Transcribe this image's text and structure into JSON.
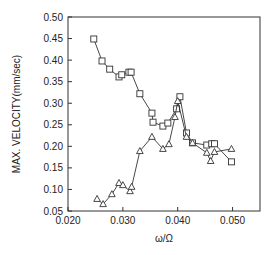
{
  "chart_data": {
    "type": "line",
    "title": "",
    "xlabel": "ω/Ω",
    "ylabel": "MAX. VELOCITY(mm/sec)",
    "xlim": [
      0.02,
      0.055
    ],
    "ylim": [
      0.05,
      0.5
    ],
    "xticks": [
      "0.020",
      "0.030",
      "0.040",
      "0.050"
    ],
    "xtick_values": [
      0.02,
      0.03,
      0.04,
      0.05
    ],
    "yticks": [
      "0.05",
      "0.10",
      "0.15",
      "0.20",
      "0.25",
      "0.30",
      "0.35",
      "0.40",
      "0.45",
      "0.50"
    ],
    "ytick_values": [
      0.05,
      0.1,
      0.15,
      0.2,
      0.25,
      0.3,
      0.35,
      0.4,
      0.45,
      0.5
    ],
    "grid": false,
    "legend": null,
    "series": [
      {
        "name": "squares",
        "marker": "square",
        "x": [
          0.0247,
          0.0262,
          0.0276,
          0.0293,
          0.0298,
          0.0311,
          0.0315,
          0.0331,
          0.0353,
          0.0355,
          0.0373,
          0.0382,
          0.0398,
          0.0404,
          0.0416,
          0.0427,
          0.0453,
          0.0462,
          0.0467,
          0.0498
        ],
        "y": [
          0.449,
          0.398,
          0.379,
          0.361,
          0.366,
          0.372,
          0.372,
          0.322,
          0.277,
          0.256,
          0.247,
          0.254,
          0.287,
          0.315,
          0.231,
          0.208,
          0.203,
          0.206,
          0.206,
          0.164
        ]
      },
      {
        "name": "triangles",
        "marker": "triangle",
        "x": [
          0.0253,
          0.0264,
          0.028,
          0.0293,
          0.03,
          0.0313,
          0.0316,
          0.0331,
          0.0353,
          0.0373,
          0.0384,
          0.0395,
          0.04,
          0.0416,
          0.0427,
          0.0453,
          0.046,
          0.0467,
          0.0498
        ],
        "y": [
          0.078,
          0.066,
          0.089,
          0.115,
          0.11,
          0.096,
          0.106,
          0.189,
          0.222,
          0.194,
          0.205,
          0.268,
          0.305,
          0.222,
          0.208,
          0.185,
          0.166,
          0.187,
          0.194
        ]
      }
    ]
  }
}
